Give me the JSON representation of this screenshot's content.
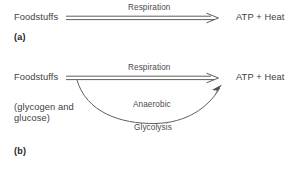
{
  "figure": {
    "type": "scientific-diagram",
    "background_color": "#ffffff",
    "line_color": "#4d4d4d",
    "text_color": "#404040"
  },
  "panel_a": {
    "tag": "(a)",
    "source_label": "Foodstuffs",
    "arrow_label": "Respiration",
    "product_label": "ATP + Heat"
  },
  "panel_b": {
    "tag": "(b)",
    "source_label": "Foodstuffs",
    "source_sublabel_line1": "(glycogen and",
    "source_sublabel_line2": "glucose)",
    "arrow_label": "Respiration",
    "product_label": "ATP + Heat",
    "curve_label_line1": "Anaerobic",
    "curve_label_line2": "Glycolysis"
  }
}
